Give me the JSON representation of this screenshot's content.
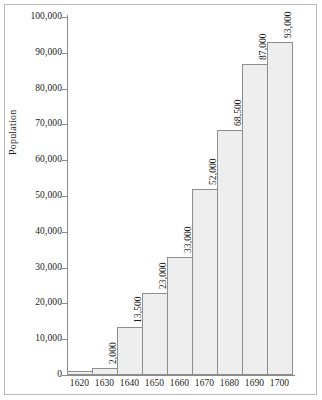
{
  "chart_data": {
    "type": "bar",
    "title": "",
    "xlabel": "",
    "ylabel": "Population",
    "categories": [
      "1620",
      "1630",
      "1640",
      "1650",
      "1660",
      "1670",
      "1680",
      "1690",
      "1700"
    ],
    "values": [
      1000,
      2000,
      13500,
      23000,
      33000,
      52000,
      68500,
      87000,
      93000
    ],
    "bar_labels": [
      "",
      "2,000",
      "13,500",
      "23,000",
      "33,000",
      "52,000",
      "68,500",
      "87,000",
      "93,000"
    ],
    "ylim": [
      0,
      100000
    ],
    "ytick_values": [
      0,
      10000,
      20000,
      30000,
      40000,
      50000,
      60000,
      70000,
      80000,
      90000,
      100000
    ],
    "ytick_labels": [
      "0",
      "10,000",
      "20,000",
      "30,000",
      "40,000",
      "50,000",
      "60,000",
      "70,000",
      "80,000",
      "90,000",
      "100,000"
    ],
    "grid": false,
    "legend": false,
    "bar_fill_color": "#eeeeee",
    "bar_border_color": "#8e8e8e",
    "axis_color": "#8a8a8a",
    "text_color": "#1a1a1a"
  }
}
